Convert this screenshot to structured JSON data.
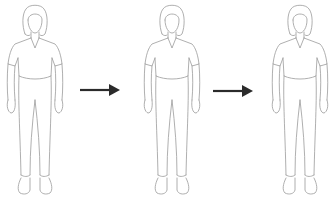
{
  "diagram": {
    "type": "sequence",
    "stroke_color": "#9a9a9a",
    "arrow_color": "#2b2b2b",
    "background": "#ffffff",
    "figures": [
      {
        "id": "figure-1",
        "description": "standing woman, front view, short-sleeve v-neck shirt and trousers",
        "left": 0
      },
      {
        "id": "figure-2",
        "description": "standing woman, front view, short-sleeve v-neck shirt and trousers",
        "left": 137
      },
      {
        "id": "figure-3",
        "description": "standing woman, front view, short-sleeve v-neck shirt and trousers",
        "left": 265
      }
    ],
    "arrows": [
      {
        "id": "arrow-1",
        "direction": "right",
        "from": "figure-1",
        "to": "figure-2"
      },
      {
        "id": "arrow-2",
        "direction": "right",
        "from": "figure-2",
        "to": "figure-3"
      }
    ]
  }
}
